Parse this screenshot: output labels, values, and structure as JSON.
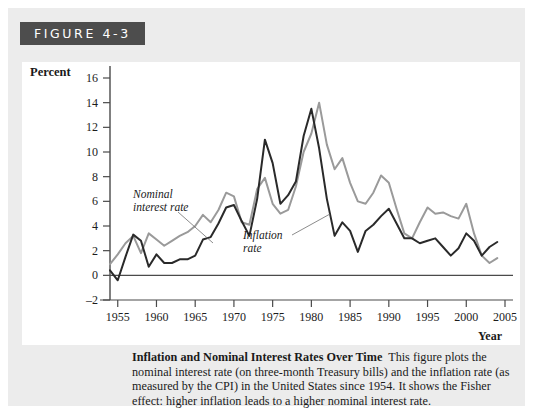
{
  "figure": {
    "banner_label": "FIGURE 4-3"
  },
  "caption": {
    "title": "Inflation and Nominal Interest Rates Over Time",
    "body": "This figure plots the nominal interest rate (on three-month Treasury bills) and the inflation rate (as measured by the CPI) in the United States since 1954. It shows the Fisher effect: higher inflation leads to a higher nominal interest rate."
  },
  "colors": {
    "nominal_line": "#9a9a9a",
    "inflation_line": "#2a2a2a",
    "banner_bg": "#4d4d4d",
    "panel_bg": "#ececec",
    "plot_bg": "#ffffff",
    "axis": "#4a4a4a"
  },
  "chart_data": {
    "type": "line",
    "title": "Inflation and Nominal Interest Rates Over Time",
    "xlabel": "Year",
    "ylabel": "Percent",
    "xlim": [
      1954,
      2005
    ],
    "ylim": [
      -2,
      17
    ],
    "yticks": [
      -2,
      0,
      2,
      4,
      6,
      8,
      10,
      12,
      14,
      16
    ],
    "xticks": [
      1955,
      1960,
      1965,
      1970,
      1975,
      1980,
      1985,
      1990,
      1995,
      2000,
      2005
    ],
    "grid": false,
    "legend": "annotations",
    "annotations": [
      {
        "text": "Nominal interest rate",
        "lines": [
          "Nominal",
          "interest rate"
        ],
        "target_year": 1972,
        "target_value": 4.5
      },
      {
        "text": "Inflation rate",
        "lines": [
          "Inflation",
          "rate"
        ],
        "target_year": 1983,
        "target_value": 6.2
      }
    ],
    "x": [
      1954,
      1955,
      1956,
      1957,
      1958,
      1959,
      1960,
      1961,
      1962,
      1963,
      1964,
      1965,
      1966,
      1967,
      1968,
      1969,
      1970,
      1971,
      1972,
      1973,
      1974,
      1975,
      1976,
      1977,
      1978,
      1979,
      1980,
      1981,
      1982,
      1983,
      1984,
      1985,
      1986,
      1987,
      1988,
      1989,
      1990,
      1991,
      1992,
      1993,
      1994,
      1995,
      1996,
      1997,
      1998,
      1999,
      2000,
      2001,
      2002,
      2003,
      2004
    ],
    "series": [
      {
        "name": "Nominal interest rate",
        "color": "#9a9a9a",
        "values": [
          0.9,
          1.7,
          2.6,
          3.2,
          1.8,
          3.4,
          2.9,
          2.4,
          2.8,
          3.2,
          3.5,
          4.0,
          4.9,
          4.3,
          5.3,
          6.7,
          6.4,
          4.3,
          4.1,
          7.0,
          7.9,
          5.8,
          5.0,
          5.3,
          7.2,
          10.0,
          11.5,
          14.0,
          10.6,
          8.6,
          9.5,
          7.5,
          6.0,
          5.8,
          6.7,
          8.1,
          7.5,
          5.4,
          3.4,
          3.0,
          4.3,
          5.5,
          5.0,
          5.1,
          4.8,
          4.6,
          5.8,
          3.4,
          1.6,
          1.0,
          1.4
        ]
      },
      {
        "name": "Inflation rate",
        "color": "#2a2a2a",
        "values": [
          0.4,
          -0.4,
          1.5,
          3.3,
          2.8,
          0.7,
          1.7,
          1.0,
          1.0,
          1.3,
          1.3,
          1.6,
          2.9,
          3.1,
          4.2,
          5.5,
          5.7,
          4.4,
          3.2,
          6.2,
          11.0,
          9.1,
          5.8,
          6.5,
          7.6,
          11.3,
          13.5,
          10.3,
          6.2,
          3.2,
          4.3,
          3.6,
          1.9,
          3.6,
          4.1,
          4.8,
          5.4,
          4.2,
          3.0,
          3.0,
          2.6,
          2.8,
          3.0,
          2.3,
          1.6,
          2.2,
          3.4,
          2.8,
          1.6,
          2.3,
          2.7
        ]
      }
    ]
  }
}
